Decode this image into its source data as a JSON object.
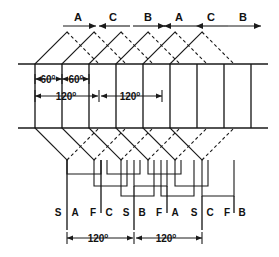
{
  "diagram": {
    "type": "winding-diagram",
    "colors": {
      "line": "#1a1a1a",
      "background": "#ffffff"
    },
    "phase_labels": [
      {
        "text": "A",
        "x": 78,
        "arrow": "right"
      },
      {
        "text": "C",
        "x": 113,
        "arrow": "left"
      },
      {
        "text": "B",
        "x": 148,
        "arrow": "right"
      },
      {
        "text": "A",
        "x": 178,
        "arrow": "left"
      },
      {
        "text": "C",
        "x": 210,
        "arrow": "left"
      },
      {
        "text": "B",
        "x": 242,
        "arrow": "right"
      }
    ],
    "angle_annotations": [
      {
        "value": "60",
        "unit": "o",
        "x": 48,
        "y": 79,
        "row": "upper"
      },
      {
        "value": "60",
        "unit": "o",
        "x": 88,
        "y": 79,
        "row": "upper"
      },
      {
        "value": "120",
        "unit": "o",
        "x": 66,
        "y": 96,
        "row": "lower"
      },
      {
        "value": "120",
        "unit": "o",
        "x": 128,
        "y": 96,
        "row": "lower"
      }
    ],
    "bottom_terminal_labels": [
      {
        "text": "S",
        "x": 58
      },
      {
        "text": "A",
        "x": 71
      },
      {
        "text": "F",
        "x": 94
      },
      {
        "text": "C",
        "x": 106
      },
      {
        "text": "S",
        "x": 128
      },
      {
        "text": "B",
        "x": 140
      },
      {
        "text": "F",
        "x": 161
      },
      {
        "text": "A",
        "x": 174
      },
      {
        "text": "S",
        "x": 195
      },
      {
        "text": "C",
        "x": 208
      },
      {
        "text": "F",
        "x": 229
      },
      {
        "text": "B",
        "x": 241
      }
    ],
    "bottom_dimensions": [
      {
        "value": "120",
        "unit": "o",
        "x": 96,
        "y": 238
      },
      {
        "value": "120",
        "unit": "o",
        "x": 160,
        "y": 238
      }
    ],
    "slots": {
      "count": 9,
      "x_positions": [
        35,
        62,
        89,
        116,
        143,
        170,
        197,
        224,
        251
      ],
      "top_rail_y": 64,
      "bottom_rail_y": 128
    },
    "rails": {
      "top": {
        "y": 64,
        "x1": 18,
        "x2": 268
      },
      "bottom": {
        "y": 128,
        "x1": 18,
        "x2": 268
      }
    }
  }
}
